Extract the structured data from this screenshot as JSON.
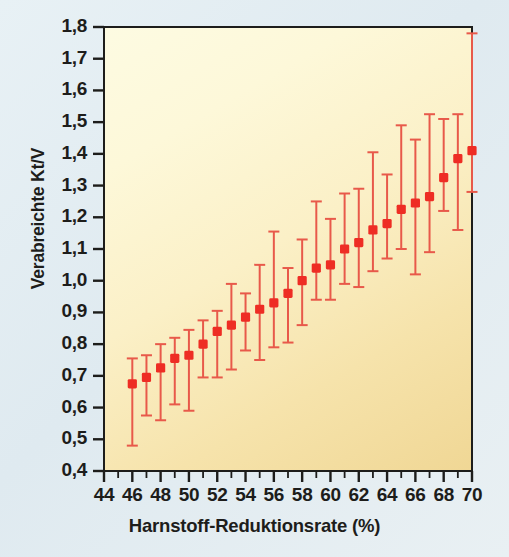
{
  "chart_data": {
    "type": "scatter",
    "title": "",
    "xlabel": "Harnstoff-Reduktionsrate (%)",
    "ylabel": "Verabreichte Kt/V",
    "xlim": [
      44,
      70
    ],
    "ylim": [
      0.4,
      1.8
    ],
    "grid": false,
    "legend": null,
    "marker_color": "#ee2d24",
    "errorbar_color": "#e8594a",
    "xticks": [
      44,
      46,
      48,
      50,
      52,
      54,
      56,
      58,
      60,
      62,
      64,
      66,
      68,
      70
    ],
    "xtick_labels": [
      "44",
      "46",
      "48",
      "50",
      "52",
      "54",
      "56",
      "58",
      "60",
      "62",
      "64",
      "66",
      "68",
      "70"
    ],
    "xminor_step": 1,
    "yticks": [
      0.4,
      0.5,
      0.6,
      0.7,
      0.8,
      0.9,
      1.0,
      1.1,
      1.2,
      1.3,
      1.4,
      1.5,
      1.6,
      1.7,
      1.8
    ],
    "ytick_labels": [
      "0,4",
      "0,5",
      "0,6",
      "0,7",
      "0,8",
      "0,9",
      "1,0",
      "1,1",
      "1,2",
      "1,3",
      "1,4",
      "1,5",
      "1,6",
      "1,7",
      "1,8"
    ],
    "x": [
      46,
      47,
      48,
      49,
      50,
      51,
      52,
      53,
      54,
      55,
      56,
      57,
      58,
      59,
      60,
      61,
      62,
      63,
      64,
      65,
      66,
      67,
      68,
      69,
      70
    ],
    "values": [
      0.675,
      0.695,
      0.725,
      0.755,
      0.765,
      0.8,
      0.84,
      0.86,
      0.885,
      0.91,
      0.93,
      0.96,
      1.0,
      1.04,
      1.05,
      1.1,
      1.12,
      1.16,
      1.18,
      1.225,
      1.245,
      1.265,
      1.325,
      1.385,
      1.41
    ],
    "err_low": [
      0.48,
      0.575,
      0.56,
      0.61,
      0.59,
      0.695,
      0.695,
      0.72,
      0.78,
      0.75,
      0.79,
      0.805,
      0.86,
      0.94,
      0.94,
      0.99,
      0.98,
      1.03,
      1.07,
      1.1,
      1.02,
      1.09,
      1.22,
      1.16,
      1.28
    ],
    "err_high": [
      0.755,
      0.765,
      0.8,
      0.82,
      0.845,
      0.875,
      0.905,
      0.99,
      0.96,
      1.05,
      1.155,
      1.04,
      1.13,
      1.25,
      1.195,
      1.275,
      1.29,
      1.405,
      1.335,
      1.49,
      1.445,
      1.525,
      1.51,
      1.525,
      1.78
    ]
  },
  "axes": {
    "ylabel_text": "Verabreichte Kt/V",
    "xlabel_text": "Harnstoff-Reduktionsrate (%)"
  }
}
